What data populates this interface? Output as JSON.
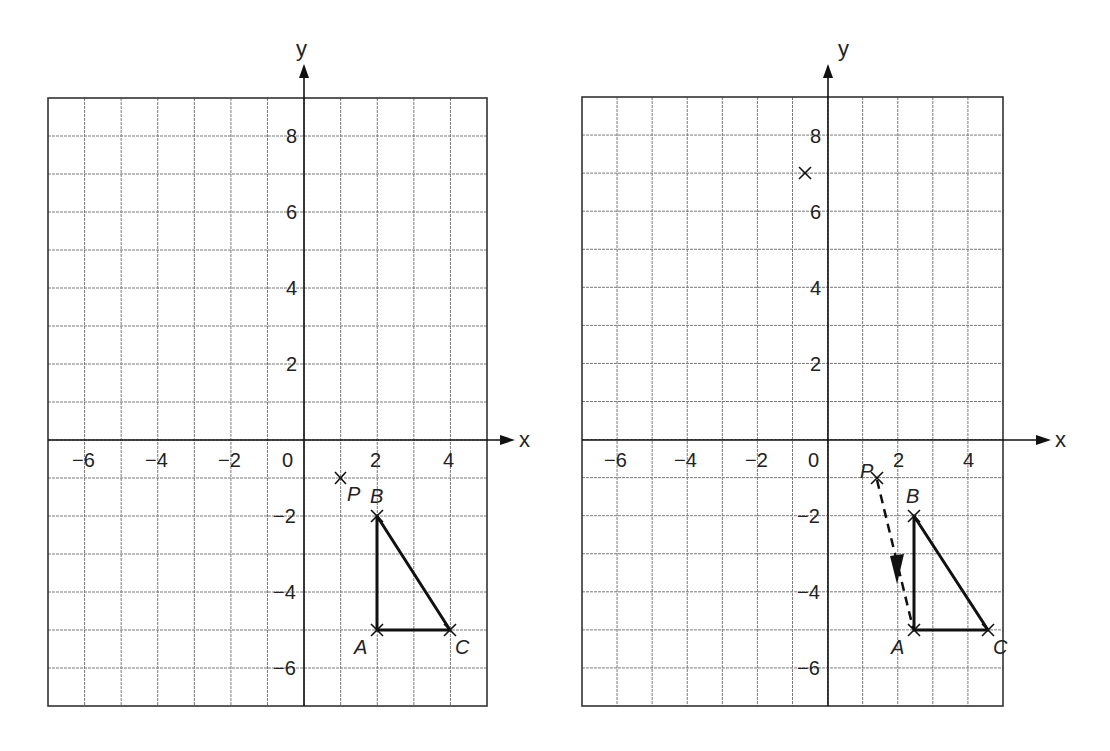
{
  "chart_data": [
    {
      "type": "scatter",
      "title": "",
      "xlabel": "x",
      "ylabel": "y",
      "xlim": [
        -7,
        5
      ],
      "ylim": [
        -7,
        9
      ],
      "grid": true,
      "x_ticks": [
        "-6",
        "-4",
        "-2",
        "0",
        "2",
        "4"
      ],
      "y_ticks": [
        "8",
        "6",
        "4",
        "2",
        "-2",
        "-4",
        "-6"
      ],
      "points": [
        {
          "label": "P",
          "x": 1,
          "y": -1
        },
        {
          "label": "A",
          "x": 2,
          "y": -5
        },
        {
          "label": "B",
          "x": 2,
          "y": -2
        },
        {
          "label": "C",
          "x": 4,
          "y": -5
        }
      ],
      "shapes": [
        {
          "type": "triangle",
          "vertices": [
            "A",
            "B",
            "C"
          ]
        }
      ]
    },
    {
      "type": "scatter",
      "title": "",
      "xlabel": "x",
      "ylabel": "y",
      "xlim": [
        -7,
        5
      ],
      "ylim": [
        -7,
        9
      ],
      "grid": true,
      "x_ticks": [
        "-6",
        "-4",
        "-2",
        "0",
        "2",
        "4"
      ],
      "y_ticks": [
        "8",
        "6",
        "4",
        "2",
        "-2",
        "-4",
        "-6"
      ],
      "points": [
        {
          "label": "P",
          "x": 1,
          "y": -1
        },
        {
          "label": "A",
          "x": 2,
          "y": -5
        },
        {
          "label": "B",
          "x": 2,
          "y": -2
        },
        {
          "label": "C",
          "x": 4,
          "y": -5
        },
        {
          "label": "",
          "x": -1,
          "y": 7
        }
      ],
      "shapes": [
        {
          "type": "triangle",
          "vertices": [
            "A",
            "B",
            "C"
          ]
        }
      ],
      "annotations": [
        {
          "type": "dashed-arrow",
          "from": "P",
          "to": "A"
        }
      ]
    }
  ],
  "left_panel": {
    "axis_x_label": "x",
    "axis_y_label": "y",
    "x_tick_labels": [
      "−6",
      "−4",
      "−2",
      "0",
      "2",
      "4"
    ],
    "y_tick_labels": [
      "8",
      "6",
      "4",
      "2",
      "−2",
      "−4",
      "−6"
    ],
    "point_labels": {
      "P": "P",
      "A": "A",
      "B": "B",
      "C": "C"
    }
  },
  "right_panel": {
    "axis_x_label": "x",
    "axis_y_label": "y",
    "x_tick_labels": [
      "−6",
      "−4",
      "−2",
      "0",
      "2",
      "4"
    ],
    "y_tick_labels": [
      "8",
      "6",
      "4",
      "2",
      "−2",
      "−4",
      "−6"
    ],
    "point_labels": {
      "P": "P",
      "A": "A",
      "B": "B",
      "C": "C"
    }
  }
}
